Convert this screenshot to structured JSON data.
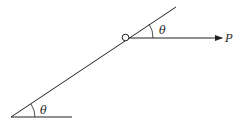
{
  "diagram": {
    "labels": {
      "angle_bottom": "θ",
      "angle_top": "θ",
      "force": "P"
    },
    "colors": {
      "stroke": "#222222",
      "background": "#ffffff"
    }
  }
}
